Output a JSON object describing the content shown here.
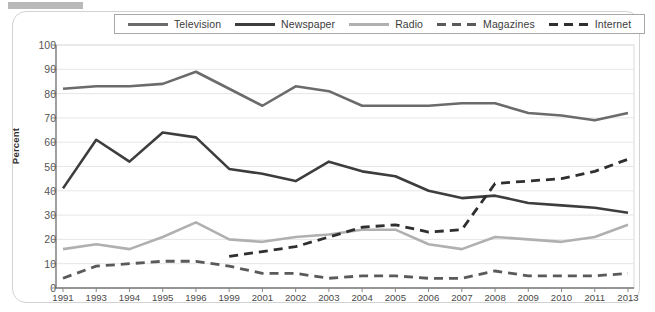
{
  "chart_data": {
    "type": "line",
    "title": "",
    "xlabel": "",
    "ylabel": "Percent",
    "ylim": [
      0,
      100
    ],
    "yticks": [
      0,
      10,
      20,
      30,
      40,
      50,
      60,
      70,
      80,
      90,
      100
    ],
    "grid": true,
    "legend_position": "top",
    "categories": [
      "1991",
      "1993",
      "1994",
      "1995",
      "1996",
      "1999",
      "2001",
      "2002",
      "2003",
      "2004",
      "2005",
      "2006",
      "2007",
      "2008",
      "2009",
      "2010",
      "2011",
      "2013"
    ],
    "series": [
      {
        "name": "Television",
        "color": "#6b6b6b",
        "style": "solid",
        "width": 2.6,
        "values": [
          82,
          83,
          83,
          84,
          89,
          82,
          75,
          83,
          81,
          75,
          75,
          75,
          76,
          76,
          72,
          71,
          69,
          72
        ]
      },
      {
        "name": "Newspaper",
        "color": "#3d3d3d",
        "style": "solid",
        "width": 2.6,
        "values": [
          41,
          61,
          52,
          64,
          62,
          49,
          47,
          44,
          52,
          48,
          46,
          40,
          37,
          38,
          35,
          34,
          33,
          31
        ]
      },
      {
        "name": "Radio",
        "color": "#b0b0b0",
        "style": "solid",
        "width": 2.6,
        "values": [
          16,
          18,
          16,
          21,
          27,
          20,
          19,
          21,
          22,
          24,
          24,
          18,
          16,
          21,
          20,
          19,
          21,
          26
        ]
      },
      {
        "name": "Magazines",
        "color": "#5a5a5a",
        "style": "dashed",
        "width": 2.8,
        "values": [
          4,
          9,
          10,
          11,
          11,
          9,
          6,
          6,
          4,
          5,
          5,
          4,
          4,
          7,
          5,
          5,
          5,
          6
        ]
      },
      {
        "name": "Internet",
        "color": "#2f2f2f",
        "style": "dashed",
        "width": 2.8,
        "values": [
          null,
          null,
          null,
          null,
          null,
          13,
          15,
          17,
          21,
          25,
          26,
          23,
          24,
          43,
          44,
          45,
          48,
          53
        ]
      }
    ]
  },
  "legend": {
    "items": [
      {
        "label": "Television"
      },
      {
        "label": "Newspaper"
      },
      {
        "label": "Radio"
      },
      {
        "label": "Magazines"
      },
      {
        "label": "Internet"
      }
    ]
  }
}
